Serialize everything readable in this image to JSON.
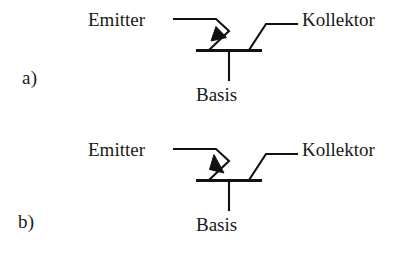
{
  "document": {
    "title": "Transistor-Schaltzeichen",
    "background_color": "#ffffff",
    "ink_color": "#111111"
  },
  "figures": [
    {
      "panel_label": "a)",
      "type": "pnp",
      "emitter_label": "Emitter",
      "collector_label": "Kollektor",
      "base_label": "Basis",
      "arrow_direction": "outward-from-base"
    },
    {
      "panel_label": "b)",
      "type": "npn",
      "emitter_label": "Emitter",
      "collector_label": "Kollektor",
      "base_label": "Basis",
      "arrow_direction": "inward-to-base"
    }
  ]
}
